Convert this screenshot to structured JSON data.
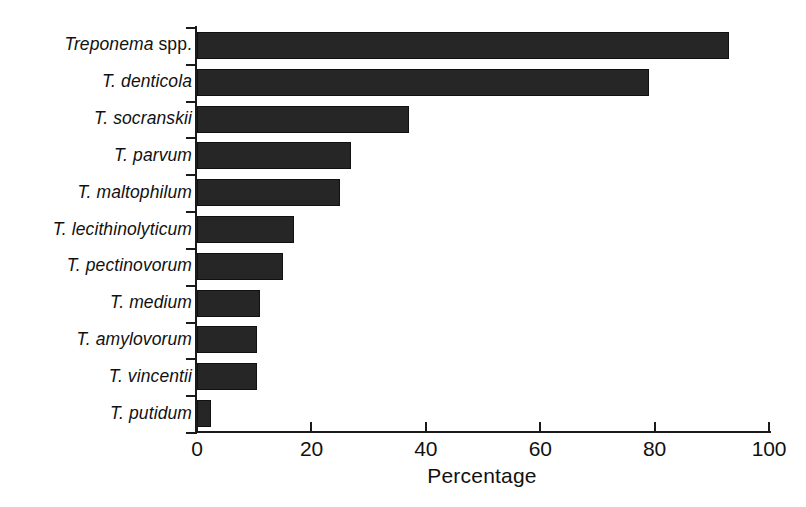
{
  "chart_data": {
    "type": "bar",
    "orientation": "horizontal",
    "title": "",
    "xlabel": "Percentage",
    "ylabel": "",
    "xlim": [
      0,
      100
    ],
    "xticks": [
      0,
      20,
      40,
      60,
      80,
      100
    ],
    "xtick_labels": [
      "0",
      "20",
      "40",
      "60",
      "80",
      "100"
    ],
    "grid": false,
    "legend": null,
    "bar_color": "#262626",
    "axis_color": "#1a1a1a",
    "background_color": "#ffffff",
    "categories": [
      "Treponema spp.",
      "T. denticola",
      "T. socranskii",
      "T. parvum",
      "T. maltophilum",
      "T. lecithinolyticum",
      "T. pectinovorum",
      "T. medium",
      "T. amylovorum",
      "T. vincentii",
      "T. putidum"
    ],
    "values": [
      93,
      79,
      37,
      27,
      25,
      17,
      15,
      11,
      10.5,
      10.5,
      2.5
    ],
    "category_parts": [
      {
        "italic": "Treponema",
        "roman": " spp."
      },
      {
        "italic": "T. denticola",
        "roman": ""
      },
      {
        "italic": "T. socranskii",
        "roman": ""
      },
      {
        "italic": "T. parvum",
        "roman": ""
      },
      {
        "italic": "T. maltophilum",
        "roman": ""
      },
      {
        "italic": "T. lecithinolyticum",
        "roman": ""
      },
      {
        "italic": "T. pectinovorum",
        "roman": ""
      },
      {
        "italic": "T. medium",
        "roman": ""
      },
      {
        "italic": "T. amylovorum",
        "roman": ""
      },
      {
        "italic": "T. vincentii",
        "roman": ""
      },
      {
        "italic": "T. putidum",
        "roman": ""
      }
    ]
  },
  "axis": {
    "x_title": "Percentage"
  }
}
